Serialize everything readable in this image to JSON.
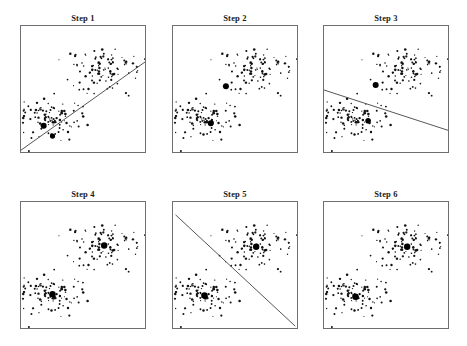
{
  "figure": {
    "width": 467,
    "height": 346,
    "background": "#ffffff",
    "frame_color": "#6e6e73",
    "point_color": "#111111",
    "centroid_color": "#000000",
    "line_color": "#444444",
    "rows": 2,
    "cols": 3
  },
  "panels": [
    {
      "id": "step-1",
      "title": "Step 1",
      "x": 20,
      "y": 25,
      "width": 126,
      "height": 128,
      "has_boundary_line": true,
      "boundary": {
        "x1": 0.0,
        "y1": 0.97,
        "x2": 1.0,
        "y2": 0.27
      },
      "centroids": [
        {
          "x": 0.18,
          "y": 0.78,
          "r": 3.0
        },
        {
          "x": 0.25,
          "y": 0.86,
          "r": 2.6
        }
      ]
    },
    {
      "id": "step-2",
      "title": "Step 2",
      "x": 172,
      "y": 25,
      "width": 126,
      "height": 128,
      "has_boundary_line": false,
      "boundary": null,
      "centroids": [
        {
          "x": 0.42,
          "y": 0.47,
          "r": 3.0
        },
        {
          "x": 0.3,
          "y": 0.76,
          "r": 3.0
        }
      ]
    },
    {
      "id": "step-3",
      "title": "Step 3",
      "x": 323,
      "y": 25,
      "width": 126,
      "height": 128,
      "has_boundary_line": true,
      "boundary": {
        "x1": 0.0,
        "y1": 0.5,
        "x2": 1.0,
        "y2": 0.82
      },
      "centroids": [
        {
          "x": 0.41,
          "y": 0.46,
          "r": 3.0
        },
        {
          "x": 0.35,
          "y": 0.74,
          "r": 2.8
        }
      ]
    },
    {
      "id": "step-4",
      "title": "Step 4",
      "x": 20,
      "y": 201,
      "width": 126,
      "height": 128,
      "has_boundary_line": false,
      "boundary": null,
      "centroids": [
        {
          "x": 0.66,
          "y": 0.34,
          "r": 3.2
        },
        {
          "x": 0.25,
          "y": 0.72,
          "r": 3.2
        }
      ]
    },
    {
      "id": "step-5",
      "title": "Step 5",
      "x": 172,
      "y": 201,
      "width": 126,
      "height": 128,
      "has_boundary_line": true,
      "boundary": {
        "x1": 0.02,
        "y1": 0.1,
        "x2": 0.97,
        "y2": 0.97
      },
      "centroids": [
        {
          "x": 0.66,
          "y": 0.35,
          "r": 3.2
        },
        {
          "x": 0.25,
          "y": 0.73,
          "r": 3.2
        }
      ]
    },
    {
      "id": "step-6",
      "title": "Step 6",
      "x": 323,
      "y": 201,
      "width": 126,
      "height": 128,
      "has_boundary_line": false,
      "boundary": null,
      "centroids": [
        {
          "x": 0.66,
          "y": 0.35,
          "r": 3.2
        },
        {
          "x": 0.25,
          "y": 0.74,
          "r": 3.2
        }
      ]
    }
  ],
  "chart_data": {
    "type": "scatter",
    "title": "",
    "xlabel": "",
    "ylabel": "",
    "xlim": [
      0,
      1
    ],
    "ylim": [
      0,
      1
    ],
    "grid": false,
    "legend": false,
    "axis_ticks": false,
    "panel_titles": [
      "Step 1",
      "Step 2",
      "Step 3",
      "Step 4",
      "Step 5",
      "Step 6"
    ],
    "cluster_count": 2,
    "points_per_cluster": 100,
    "clusters": [
      {
        "name": "upper-right cluster",
        "center": [
          0.66,
          0.34
        ],
        "spread": [
          0.13,
          0.13
        ],
        "n": 100
      },
      {
        "name": "lower-left cluster",
        "center": [
          0.25,
          0.73
        ],
        "spread": [
          0.13,
          0.13
        ],
        "n": 100
      }
    ],
    "series": [
      {
        "name": "Step 1",
        "centroids": [
          [
            0.18,
            0.78
          ],
          [
            0.25,
            0.86
          ]
        ],
        "boundary": [
          [
            0.0,
            0.97
          ],
          [
            1.0,
            0.27
          ]
        ]
      },
      {
        "name": "Step 2",
        "centroids": [
          [
            0.42,
            0.47
          ],
          [
            0.3,
            0.76
          ]
        ],
        "boundary": null
      },
      {
        "name": "Step 3",
        "centroids": [
          [
            0.41,
            0.46
          ],
          [
            0.35,
            0.74
          ]
        ],
        "boundary": [
          [
            0.0,
            0.5
          ],
          [
            1.0,
            0.82
          ]
        ]
      },
      {
        "name": "Step 4",
        "centroids": [
          [
            0.66,
            0.34
          ],
          [
            0.25,
            0.72
          ]
        ],
        "boundary": null
      },
      {
        "name": "Step 5",
        "centroids": [
          [
            0.66,
            0.35
          ],
          [
            0.25,
            0.73
          ]
        ],
        "boundary": [
          [
            0.02,
            0.1
          ],
          [
            0.97,
            0.97
          ]
        ]
      },
      {
        "name": "Step 6",
        "centroids": [
          [
            0.66,
            0.35
          ],
          [
            0.25,
            0.74
          ]
        ],
        "boundary": null
      }
    ]
  }
}
